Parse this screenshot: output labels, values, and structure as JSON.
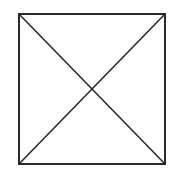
{
  "diagram": {
    "shape": "square-with-diagonals",
    "stroke_color": "#2a2a2a",
    "background": "#ffffff",
    "square": {
      "x": 19,
      "y": 14,
      "width": 146,
      "height": 150
    },
    "diagonals": [
      {
        "from": [
          19,
          14
        ],
        "to": [
          165,
          164
        ]
      },
      {
        "from": [
          165,
          14
        ],
        "to": [
          19,
          164
        ]
      }
    ]
  }
}
